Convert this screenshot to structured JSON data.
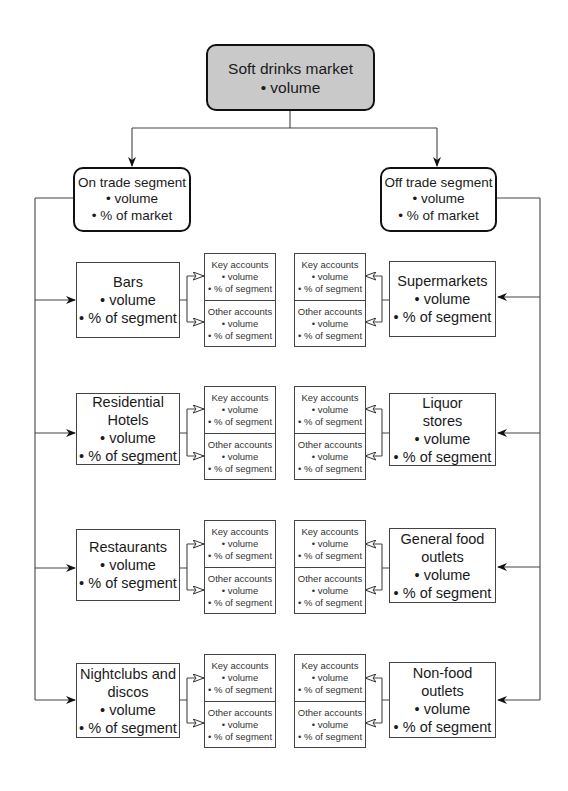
{
  "root": {
    "title": "Soft drinks market",
    "metrics": [
      "• volume"
    ]
  },
  "segments": [
    {
      "id": "on",
      "title": "On trade segment",
      "metrics": [
        "• volume",
        "• % of market"
      ]
    },
    {
      "id": "off",
      "title": "Off trade segment",
      "metrics": [
        "• volume",
        "• % of market"
      ]
    }
  ],
  "on_trade_categories": [
    {
      "lines": [
        "Bars",
        "• volume",
        "• % of segment"
      ]
    },
    {
      "lines": [
        "Residential",
        "Hotels",
        "• volume",
        "• % of segment"
      ]
    },
    {
      "lines": [
        "Restaurants",
        "• volume",
        "• % of segment"
      ]
    },
    {
      "lines": [
        "Nightclubs and",
        "discos",
        "• volume",
        "• % of segment"
      ]
    }
  ],
  "off_trade_categories": [
    {
      "lines": [
        "Supermarkets",
        "• volume",
        "• % of segment"
      ]
    },
    {
      "lines": [
        "Liquor",
        "stores",
        "• volume",
        "• % of segment"
      ]
    },
    {
      "lines": [
        "General food",
        "outlets",
        "• volume",
        "• % of segment"
      ]
    },
    {
      "lines": [
        "Non-food",
        "outlets",
        "• volume",
        "• % of segment"
      ]
    }
  ],
  "accounts": {
    "key": [
      "Key accounts",
      "• volume",
      "• % of segment"
    ],
    "other": [
      "Other accounts",
      "• volume",
      "• % of segment"
    ]
  },
  "colors": {
    "root_fill": "#c9c9c9",
    "stroke": "#111111",
    "thin_stroke": "#444444"
  }
}
